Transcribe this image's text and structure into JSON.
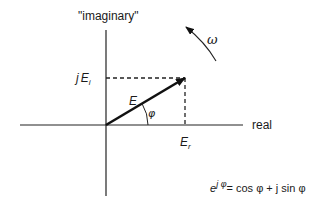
{
  "diagram": {
    "axes": {
      "imaginary_label": "\"imaginary\"",
      "real_label": "real"
    },
    "phasor": {
      "magnitude_label": "E",
      "angle_label": "φ",
      "real_component": {
        "base": "E",
        "sub": "r"
      },
      "imag_component": {
        "prefix": "j",
        "base": "E",
        "sub": "i"
      }
    },
    "rotation": {
      "label": "ω",
      "direction": "counterclockwise"
    },
    "equation": {
      "base": "e",
      "exponent": "j φ",
      "rhs": "= cos φ +  j sin φ"
    }
  }
}
